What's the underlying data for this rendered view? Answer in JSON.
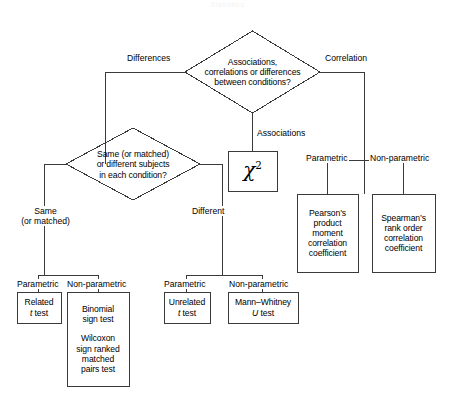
{
  "diagram": {
    "watermark": "Statistics",
    "stroke_color": "#3a3a3a",
    "background_color": "#ffffff",
    "text_color": "#000000"
  },
  "decisions": [
    {
      "id": "root-decision",
      "lines": [
        "Associations,",
        "correlations or differences",
        "between conditions?"
      ]
    },
    {
      "id": "subjects-decision",
      "lines": [
        "Same (or matched)",
        "or different subjects",
        "in each condition?"
      ]
    }
  ],
  "edge_labels": {
    "differences": "Differences",
    "correlation": "Correlation",
    "associations": "Associations",
    "same_line1": "Same",
    "same_line2": "(or matched)",
    "different": "Different",
    "param_left": "Parametric",
    "nonparam_left": "Non-parametric",
    "param_right": "Parametric",
    "nonparam_right": "Non-parametric",
    "param_corr": "Parametric",
    "nonparam_corr": "Non-parametric"
  },
  "tests": {
    "chi_square": {
      "symbol": "χ",
      "exponent": "2"
    },
    "related_t": {
      "line1": "Related",
      "italic": "t",
      "line2": "test"
    },
    "nonparam_same": {
      "line1": "Binomial",
      "line2": "sign test",
      "line3": "Wilcoxon",
      "line4": "sign ranked",
      "line5": "matched",
      "line6": "pairs test"
    },
    "unrelated_t": {
      "line1": "Unrelated",
      "italic": "t",
      "line2": "test"
    },
    "mann_whitney": {
      "line1": "Mann–Whitney",
      "italic": "U",
      "line2": "test"
    },
    "pearson": {
      "line1": "Pearson’s",
      "line2": "product",
      "line3": "moment",
      "line4": "correlation",
      "line5": "coefficient"
    },
    "spearman": {
      "line1": "Spearman’s",
      "line2": "rank order",
      "line3": "correlation",
      "line4": "coefficient"
    }
  }
}
